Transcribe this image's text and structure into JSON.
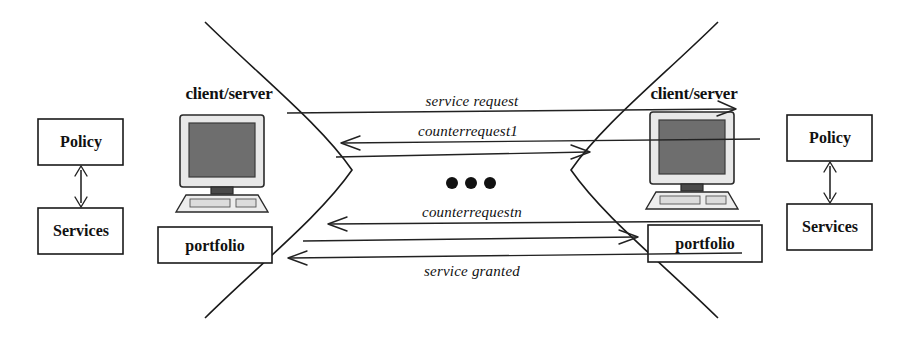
{
  "diagram": {
    "colors": {
      "stroke": "#1a1a1a",
      "background": "#ffffff",
      "screen": "#6e6e6e",
      "bezel": "#e8e8e8"
    },
    "left_side": {
      "policy_label": "Policy",
      "services_label": "Services",
      "actor_label": "client/server",
      "portfolio_label": "portfolio",
      "link_arrow": "double-headed-vertical-arrow"
    },
    "right_side": {
      "policy_label": "Policy",
      "services_label": "Services",
      "actor_label": "client/server",
      "portfolio_label": "portfolio",
      "link_arrow": "double-headed-vertical-arrow"
    },
    "messages": [
      {
        "label": "service request",
        "direction": "right",
        "y": 113
      },
      {
        "label": "counterrequest1",
        "direction": "left",
        "y": 143
      },
      {
        "label": "",
        "direction": "right",
        "y": 157
      },
      {
        "label": "counterrequestn",
        "direction": "left",
        "y": 222
      },
      {
        "label": "",
        "direction": "right",
        "y": 239
      },
      {
        "label": "service granted",
        "direction": "left",
        "y": 256
      }
    ],
    "ellipsis": "● ● ●"
  }
}
